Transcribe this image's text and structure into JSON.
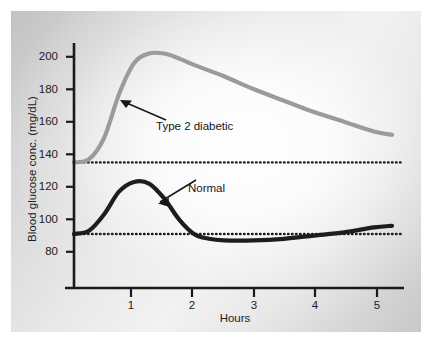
{
  "chart_data": {
    "type": "line",
    "title": "",
    "subtitle": "",
    "xlabel": "Hours",
    "ylabel": "Blood glucose conc. (mg/dL)",
    "xlim": [
      0,
      5.5
    ],
    "ylim": [
      72,
      210
    ],
    "grid": false,
    "legend": "none",
    "x_ticks": [
      1,
      2,
      3,
      4,
      5
    ],
    "x_tick_labels": [
      "1",
      "2",
      "3",
      "4",
      "5"
    ],
    "y_ticks": [
      80,
      100,
      120,
      140,
      160,
      180,
      200
    ],
    "y_tick_labels": [
      "80",
      "100",
      "120",
      "140",
      "160",
      "180",
      "200"
    ],
    "series": [
      {
        "name": "Type 2 diabetic",
        "color": "#9b9b9b",
        "baseline": 135,
        "peak_value": 202,
        "peak_hour": 1.25,
        "end_value": 152,
        "x": [
          0,
          0.25,
          0.5,
          0.75,
          1.0,
          1.25,
          1.5,
          1.75,
          2.0,
          2.5,
          3.0,
          3.5,
          4.0,
          4.5,
          5.0,
          5.3
        ],
        "values": [
          135,
          137,
          150,
          177,
          196,
          202,
          202,
          199,
          195,
          188,
          180,
          173,
          166,
          160,
          154,
          152
        ]
      },
      {
        "name": "Normal",
        "color": "#1d1d1d",
        "baseline": 91,
        "peak_value": 123,
        "peak_hour": 1.0,
        "end_value": 96,
        "x": [
          0,
          0.25,
          0.5,
          0.75,
          1.0,
          1.25,
          1.5,
          1.75,
          2.0,
          2.25,
          2.5,
          3.0,
          3.5,
          4.0,
          4.5,
          5.0,
          5.3
        ],
        "values": [
          91,
          93,
          103,
          117,
          123,
          122,
          113,
          100,
          91,
          88,
          87,
          87,
          88,
          90,
          92,
          95,
          96
        ]
      }
    ],
    "reference_lines": [
      {
        "name": "diabetic-baseline",
        "value": 135,
        "style": "dotted",
        "color": "#1d1d1d"
      },
      {
        "name": "normal-baseline",
        "value": 91,
        "style": "dotted",
        "color": "#1d1d1d"
      }
    ],
    "annotations": [
      {
        "name": "Type 2 diabetic",
        "label": "Type 2 diabetic",
        "points_to_hour": 0.75,
        "points_to_value": 172
      },
      {
        "name": "Normal",
        "label": "Normal",
        "points_to_hour": 1.6,
        "points_to_value": 110
      }
    ]
  }
}
